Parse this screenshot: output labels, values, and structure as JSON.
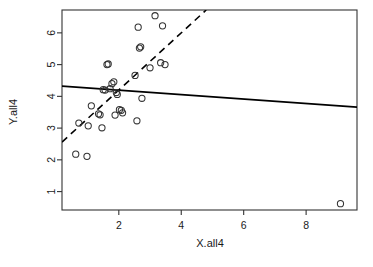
{
  "chart_data": {
    "type": "scatter",
    "title": "",
    "subtitle": "",
    "xlabel": "X.all4",
    "ylabel": "Y.all4",
    "xlim": [
      0.18,
      9.63
    ],
    "ylim": [
      0.42,
      6.72
    ],
    "x_ticks": [
      2,
      4,
      6,
      8
    ],
    "y_ticks": [
      1,
      2,
      3,
      4,
      5,
      6
    ],
    "grid": false,
    "legend": "none",
    "box": true,
    "point_symbol": "open-circle",
    "point_color": "#333333",
    "points": [
      {
        "x": 0.62,
        "y": 2.18
      },
      {
        "x": 0.72,
        "y": 3.16
      },
      {
        "x": 0.98,
        "y": 2.11
      },
      {
        "x": 1.02,
        "y": 3.07
      },
      {
        "x": 1.12,
        "y": 3.7
      },
      {
        "x": 1.35,
        "y": 3.45
      },
      {
        "x": 1.4,
        "y": 3.42
      },
      {
        "x": 1.46,
        "y": 3.01
      },
      {
        "x": 1.5,
        "y": 4.21
      },
      {
        "x": 1.56,
        "y": 4.2
      },
      {
        "x": 1.62,
        "y": 5.0
      },
      {
        "x": 1.66,
        "y": 5.02
      },
      {
        "x": 1.72,
        "y": 4.24
      },
      {
        "x": 1.78,
        "y": 4.4
      },
      {
        "x": 1.84,
        "y": 4.46
      },
      {
        "x": 1.88,
        "y": 3.41
      },
      {
        "x": 1.92,
        "y": 4.12
      },
      {
        "x": 1.95,
        "y": 4.06
      },
      {
        "x": 2.02,
        "y": 3.58
      },
      {
        "x": 2.08,
        "y": 3.56
      },
      {
        "x": 2.12,
        "y": 3.48
      },
      {
        "x": 2.52,
        "y": 4.66
      },
      {
        "x": 2.58,
        "y": 3.23
      },
      {
        "x": 2.62,
        "y": 6.18
      },
      {
        "x": 2.66,
        "y": 5.52
      },
      {
        "x": 2.7,
        "y": 5.56
      },
      {
        "x": 2.74,
        "y": 3.94
      },
      {
        "x": 3.0,
        "y": 4.9
      },
      {
        "x": 3.16,
        "y": 6.54
      },
      {
        "x": 3.34,
        "y": 5.06
      },
      {
        "x": 3.4,
        "y": 6.22
      },
      {
        "x": 3.48,
        "y": 5.0
      },
      {
        "x": 9.1,
        "y": 0.62
      }
    ],
    "lines": [
      {
        "name": "solid-regression-line",
        "style": "solid",
        "color": "#000000",
        "width": 1.8,
        "x0": 0.18,
        "y0": 4.32,
        "x1": 9.63,
        "y1": 3.66
      },
      {
        "name": "dashed-regression-line",
        "style": "dashed",
        "color": "#000000",
        "width": 1.6,
        "x0": 0.18,
        "y0": 2.56,
        "x1": 4.8,
        "y1": 6.72
      }
    ]
  },
  "axes": {
    "x_tick_labels": [
      "2",
      "4",
      "6",
      "8"
    ],
    "y_tick_labels": [
      "1",
      "2",
      "3",
      "4",
      "5",
      "6"
    ],
    "xlabel": "X.all4",
    "ylabel": "Y.all4"
  }
}
